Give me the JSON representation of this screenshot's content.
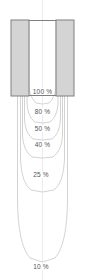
{
  "figure": {
    "title": "",
    "width_px": 85,
    "height_px": 280,
    "background_color": "#ffffff",
    "center_axis_x_px": 42.5
  },
  "aperture": {
    "name": "collimator-block",
    "outline_color": "#808080",
    "fill_color": "#d4d4d4",
    "open_field_color": "#ffffff",
    "left_px": 11,
    "right_px": 74,
    "top_px": 20,
    "bottom_px": 96,
    "opening_left_px": 29,
    "opening_right_px": 56
  },
  "axis": {
    "center_line_color": "#ececec",
    "center_line_visible": true
  },
  "chart_data": {
    "type": "line",
    "title": "",
    "subtitle": "",
    "xlabel": "",
    "ylabel": "",
    "grid": false,
    "legend_position": "inline-annotations",
    "contour_color": "#c8c8c8",
    "label_color": "#555555",
    "xlim": [
      0,
      85
    ],
    "ylim": [
      0,
      280
    ],
    "annotations": [
      {
        "text": "100 %",
        "x": 42.5,
        "y": 92
      },
      {
        "text": "80 %",
        "x": 42.5,
        "y": 112
      },
      {
        "text": "50 %",
        "x": 42.5,
        "y": 129
      },
      {
        "text": "40 %",
        "x": 42.5,
        "y": 145
      },
      {
        "text": "25 %",
        "x": 41.0,
        "y": 175
      },
      {
        "text": "10 %",
        "x": 41.0,
        "y": 267
      }
    ],
    "series": [
      {
        "name": "100 %",
        "level": 100,
        "label": "100 %",
        "half_width_top_px": 13.5,
        "depth_px": 96,
        "path": "M 29,20 L 29,88 Q 30.5,98 36,103 L 42.5,104 L 49,103 Q 54.5,98 56,88 L 56,20"
      },
      {
        "name": "80 %",
        "level": 80,
        "label": "80 %",
        "half_width_top_px": 15.5,
        "depth_px": 120,
        "path": "M 27,20 L 27,104 Q 28,117 35,122 L 42.5,123 L 50,122 Q 57,117 58,104 L 58,20"
      },
      {
        "name": "50 %",
        "level": 50,
        "label": "50 %",
        "half_width_top_px": 18,
        "depth_px": 138,
        "path": "M 24.5,20 L 24.5,120 Q 25.5,134 33,139 L 42.5,140 L 52,139 Q 59.5,134 60.5,120 L 60.5,20"
      },
      {
        "name": "40 %",
        "level": 40,
        "label": "40 %",
        "half_width_top_px": 20,
        "depth_px": 155,
        "path": "M 22.5,20 L 22.5,136 Q 23.5,151 32,157 L 42.5,158 L 53,157 Q 61.5,151 62.5,136 L 62.5,20"
      },
      {
        "name": "25 %",
        "level": 25,
        "label": "25 %",
        "half_width_top_px": 22,
        "depth_px": 190,
        "path": "M 20.5,20 L 20.5,160 Q 21.5,183 31,190 L 42.5,192 L 54,190 Q 63.5,183 64.5,160 L 64.5,20"
      },
      {
        "name": "10 %",
        "level": 10,
        "label": "10 %",
        "half_width_top_px": 25,
        "depth_px": 262,
        "path": "M 17.5,20 L 17.5,200 Q 18,245 30,258 L 42.5,262 L 55,258 Q 67,245 67.5,200 L 67.5,20"
      }
    ]
  }
}
